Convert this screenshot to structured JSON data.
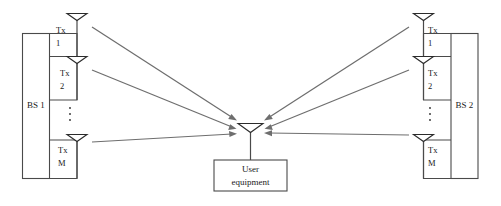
{
  "diagram": {
    "colors": {
      "background": "#ffffff",
      "structure_stroke": "#4a4a4a",
      "antenna_stroke": "#2b2b2b",
      "arrow": "#6e6e6e",
      "text": "#1a1a1a"
    },
    "base_stations": [
      {
        "id": "bs1",
        "label": "BS 1",
        "side": "left",
        "antennas": [
          {
            "id": "bs1-tx1",
            "line1": "Tx",
            "line2": "1"
          },
          {
            "id": "bs1-tx2",
            "line1": "Tx",
            "line2": "2"
          },
          {
            "id": "bs1-txm",
            "line1": "Tx",
            "line2": "M"
          }
        ],
        "ellipsis": "vertical-dots"
      },
      {
        "id": "bs2",
        "label": "BS 2",
        "side": "right",
        "antennas": [
          {
            "id": "bs2-tx1",
            "line1": "Tx",
            "line2": "1"
          },
          {
            "id": "bs2-tx2",
            "line1": "Tx",
            "line2": "2"
          },
          {
            "id": "bs2-txm",
            "line1": "Tx",
            "line2": "M"
          }
        ],
        "ellipsis": "vertical-dots"
      }
    ],
    "user_equipment": {
      "id": "ue",
      "label_line1": "User",
      "label_line2": "equipment",
      "antenna": "receive-antenna"
    },
    "signals": [
      {
        "id": "sig-bs1-tx1",
        "from": "bs1-tx1",
        "to": "ue",
        "direction": "downlink"
      },
      {
        "id": "sig-bs1-tx2",
        "from": "bs1-tx2",
        "to": "ue",
        "direction": "downlink"
      },
      {
        "id": "sig-bs1-txm",
        "from": "bs1-txm",
        "to": "ue",
        "direction": "downlink"
      },
      {
        "id": "sig-bs2-tx1",
        "from": "bs2-tx1",
        "to": "ue",
        "direction": "downlink"
      },
      {
        "id": "sig-bs2-tx2",
        "from": "bs2-tx2",
        "to": "ue",
        "direction": "downlink"
      },
      {
        "id": "sig-bs2-txm",
        "from": "bs2-txm",
        "to": "ue",
        "direction": "downlink"
      }
    ]
  }
}
